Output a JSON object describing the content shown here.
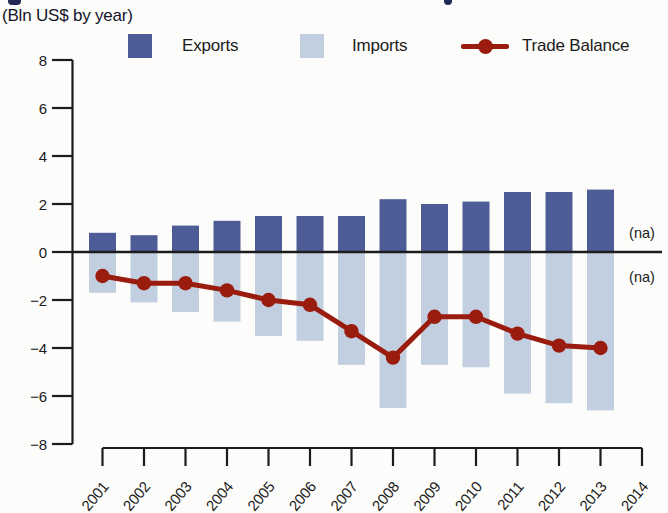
{
  "page": {
    "subtitle": "(Bln US$ by year)",
    "background": "#fcfcfa",
    "text_color": "#1c1c1c"
  },
  "legend": {
    "items": [
      {
        "label": "Exports",
        "color": "#4d5b97",
        "marker": "square-icon"
      },
      {
        "label": "Imports",
        "color": "#c2cfe0",
        "marker": "square-icon"
      },
      {
        "label": "Trade Balance",
        "color": "#9a1c0e",
        "marker": "line-dot-icon"
      }
    ]
  },
  "chart_data": {
    "type": "bar+line",
    "title": "",
    "subtitle": "(Bln US$ by year)",
    "categories": [
      "2001",
      "2002",
      "2003",
      "2004",
      "2005",
      "2006",
      "2007",
      "2008",
      "2009",
      "2010",
      "2011",
      "2012",
      "2013",
      "2014"
    ],
    "series": [
      {
        "name": "Exports",
        "kind": "bar",
        "color": "#4d5b97",
        "values": [
          0.8,
          0.7,
          1.1,
          1.3,
          1.5,
          1.5,
          1.5,
          2.2,
          2.0,
          2.1,
          2.5,
          2.5,
          2.6,
          null
        ]
      },
      {
        "name": "Imports",
        "kind": "bar",
        "color": "#c2cfe0",
        "values": [
          -1.7,
          -2.1,
          -2.5,
          -2.9,
          -3.5,
          -3.7,
          -4.7,
          -6.5,
          -4.7,
          -4.8,
          -5.9,
          -6.3,
          -6.6,
          null
        ]
      },
      {
        "name": "Trade Balance",
        "kind": "line",
        "color": "#9a1c0e",
        "values": [
          -1.0,
          -1.3,
          -1.3,
          -1.6,
          -2.0,
          -2.2,
          -3.3,
          -4.4,
          -2.7,
          -2.7,
          -3.4,
          -3.9,
          -4.0,
          null
        ]
      }
    ],
    "ylim": [
      -8,
      8
    ],
    "ytick_step": 2,
    "ytick_labels": [
      "8",
      "6",
      "4",
      "2",
      "0",
      "−2",
      "−4",
      "−6",
      "−8"
    ],
    "xlabel": "",
    "ylabel": "",
    "grid": false,
    "legend_position": "top",
    "na_text": "(na)",
    "na_annotations": [
      {
        "category": "2014",
        "series": "Exports",
        "value": 0.8
      },
      {
        "category": "2014",
        "series": "Imports",
        "value": -1.05
      }
    ]
  }
}
